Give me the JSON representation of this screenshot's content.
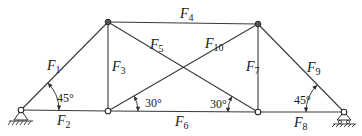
{
  "diagram": {
    "type": "truss",
    "nodes": {
      "A": {
        "x": 21,
        "y": 110,
        "support": "pin"
      },
      "B": {
        "x": 108,
        "y": 22
      },
      "C": {
        "x": 258,
        "y": 24
      },
      "D": {
        "x": 108,
        "y": 111
      },
      "E": {
        "x": 258,
        "y": 112
      },
      "G": {
        "x": 344,
        "y": 112,
        "support": "roller"
      }
    },
    "members": [
      {
        "id": "F1",
        "letter": "F",
        "sub": "1",
        "from": "A",
        "to": "B"
      },
      {
        "id": "F2",
        "letter": "F",
        "sub": "2",
        "from": "A",
        "to": "D"
      },
      {
        "id": "F3",
        "letter": "F",
        "sub": "3",
        "from": "B",
        "to": "D"
      },
      {
        "id": "F4",
        "letter": "F",
        "sub": "4",
        "from": "B",
        "to": "C"
      },
      {
        "id": "F5",
        "letter": "F",
        "sub": "5",
        "from": "B",
        "to": "E"
      },
      {
        "id": "F6",
        "letter": "F",
        "sub": "6",
        "from": "D",
        "to": "E"
      },
      {
        "id": "F7",
        "letter": "F",
        "sub": "7",
        "from": "C",
        "to": "E"
      },
      {
        "id": "F8",
        "letter": "F",
        "sub": "8",
        "from": "E",
        "to": "G"
      },
      {
        "id": "F9",
        "letter": "F",
        "sub": "9",
        "from": "C",
        "to": "G"
      },
      {
        "id": "F10",
        "letter": "F",
        "sub": "10",
        "from": "D",
        "to": "C"
      }
    ],
    "labels": {
      "F1": {
        "letter": "F",
        "sub": "1",
        "x": 47,
        "y": 70
      },
      "F2": {
        "letter": "F",
        "sub": "2",
        "x": 57,
        "y": 125
      },
      "F3": {
        "letter": "F",
        "sub": "3",
        "x": 112,
        "y": 71
      },
      "F4": {
        "letter": "F",
        "sub": "4",
        "x": 180,
        "y": 18
      },
      "F5": {
        "letter": "F",
        "sub": "5",
        "x": 150,
        "y": 49
      },
      "F6": {
        "letter": "F",
        "sub": "6",
        "x": 175,
        "y": 126
      },
      "F7": {
        "letter": "F",
        "sub": "7",
        "x": 246,
        "y": 71
      },
      "F8": {
        "letter": "F",
        "sub": "8",
        "x": 294,
        "y": 127
      },
      "F9": {
        "letter": "F",
        "sub": "9",
        "x": 307,
        "y": 72
      },
      "F10": {
        "letter": "F",
        "sub": "10",
        "x": 205,
        "y": 48
      }
    },
    "angles": [
      {
        "text": "45°",
        "x": 57,
        "y": 102
      },
      {
        "text": "30°",
        "x": 145,
        "y": 107
      },
      {
        "text": "30°",
        "x": 210,
        "y": 108
      },
      {
        "text": "45°",
        "x": 294,
        "y": 104
      }
    ],
    "colors": {
      "line": "#3a3a3a",
      "text": "#1a1a1a",
      "background": "#ffffff"
    }
  }
}
